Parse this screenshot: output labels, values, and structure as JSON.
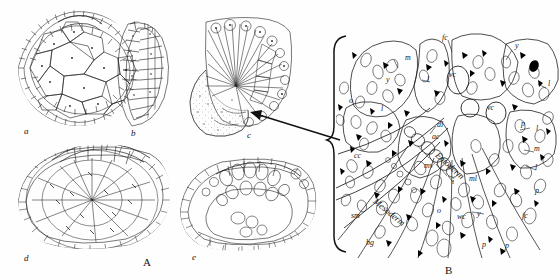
{
  "figure": {
    "type": "scientific-illustration-plate",
    "background_color": "#ffffff",
    "ink_color": "#1a1a1a",
    "width": 560,
    "height": 278
  },
  "panels": [
    {
      "id": "A",
      "letter": "A",
      "letter_pos": {
        "x": 143,
        "y": 258
      },
      "description": "group of five embryo drawings",
      "subfigures": [
        {
          "letter": "a",
          "x": 24,
          "y": 126,
          "description": "whole embryo surface view with polygonal cells"
        },
        {
          "letter": "b",
          "x": 131,
          "y": 128,
          "description": "lateral crescent-shaped section"
        },
        {
          "letter": "c",
          "x": 247,
          "y": 130,
          "description": "sectioned embryo with radiating fan of cells"
        },
        {
          "letter": "d",
          "x": 24,
          "y": 253,
          "description": "dorsal view of embryo with cell plate"
        },
        {
          "letter": "e",
          "x": 192,
          "y": 252,
          "description": "sectioned embryo showing internal cavity"
        }
      ]
    },
    {
      "id": "B",
      "letter": "B",
      "letter_pos": {
        "x": 445,
        "y": 268
      },
      "description": "magnified histological section of the gastrulation region indicated by the arrow from subfigure c",
      "brace": {
        "x": 332,
        "y_top": 36,
        "y_bottom": 252,
        "notch_y": 140
      },
      "arrow": {
        "from": {
          "x": 340,
          "y": 140
        },
        "to": {
          "x": 253,
          "y": 113
        }
      }
    }
  ],
  "labels": [
    {
      "text": "m",
      "x": 405,
      "y": 54,
      "size": 8,
      "rot": 0
    },
    {
      "text": "y",
      "x": 386,
      "y": 76,
      "size": 8,
      "rot": 0
    },
    {
      "text": "l",
      "x": 427,
      "y": 76,
      "size": 8,
      "rot": 0
    },
    {
      "text": "fc",
      "x": 442,
      "y": 34,
      "size": 8,
      "rot": 0
    },
    {
      "text": "y",
      "x": 515,
      "y": 42,
      "size": 8,
      "rot": 0
    },
    {
      "text": "l",
      "x": 548,
      "y": 80,
      "size": 8,
      "rot": 0
    },
    {
      "text": "vc",
      "x": 449,
      "y": 71,
      "size": 8,
      "rot": 0
    },
    {
      "text": "vc",
      "x": 487,
      "y": 104,
      "size": 8,
      "rot": 0
    },
    {
      "text": "o",
      "x": 349,
      "y": 97,
      "size": 8,
      "rot": 0
    },
    {
      "text": "l",
      "x": 381,
      "y": 105,
      "size": 8,
      "rot": 0
    },
    {
      "text": "dl",
      "x": 437,
      "y": 121,
      "size": 8,
      "rot": 0
    },
    {
      "text": "ac",
      "x": 432,
      "y": 133,
      "size": 8,
      "rot": 0
    },
    {
      "text": "cc",
      "x": 354,
      "y": 152,
      "size": 8,
      "rot": 0
    },
    {
      "text": "m",
      "x": 534,
      "y": 145,
      "size": 8,
      "rot": 0
    },
    {
      "text": "l",
      "x": 535,
      "y": 164,
      "size": 8,
      "rot": 0
    },
    {
      "text": "p",
      "x": 521,
      "y": 120,
      "size": 8,
      "rot": 0
    },
    {
      "text": "l",
      "x": 536,
      "y": 125,
      "size": 8,
      "rot": 0
    },
    {
      "text": "mv",
      "x": 424,
      "y": 162,
      "size": 8,
      "rot": 0
    },
    {
      "text": "ml",
      "x": 469,
      "y": 175,
      "size": 8,
      "rot": 0
    },
    {
      "text": "i",
      "x": 452,
      "y": 178,
      "size": 8,
      "rot": 0
    },
    {
      "text": "p",
      "x": 535,
      "y": 187,
      "size": 8,
      "rot": 0
    },
    {
      "text": "fc",
      "x": 522,
      "y": 212,
      "size": 8,
      "rot": 0
    },
    {
      "text": "wc",
      "x": 457,
      "y": 213,
      "size": 8,
      "rot": 0
    },
    {
      "text": "y",
      "x": 477,
      "y": 210,
      "size": 8,
      "rot": 0
    },
    {
      "text": "sm",
      "x": 351,
      "y": 212,
      "size": 8,
      "rot": 0
    },
    {
      "text": "bg",
      "x": 366,
      "y": 239,
      "size": 8,
      "rot": 0
    },
    {
      "text": "p",
      "x": 482,
      "y": 241,
      "size": 8,
      "rot": 0
    },
    {
      "text": "p",
      "x": 505,
      "y": 242,
      "size": 8,
      "rot": 0
    },
    {
      "text": "o",
      "x": 437,
      "y": 207,
      "size": 8,
      "rot": 0
    }
  ],
  "curved_labels": [
    {
      "text": "Entoderm",
      "x": 440,
      "y": 150,
      "rot": 42,
      "size": 9
    },
    {
      "text": "Mesoderm",
      "x": 378,
      "y": 196,
      "rot": 40,
      "size": 9
    }
  ],
  "colors": {
    "ink": "#1a1a1a",
    "paper": "#ffffff",
    "shade": "#d8d4cc",
    "dark_granule": "#000000"
  }
}
